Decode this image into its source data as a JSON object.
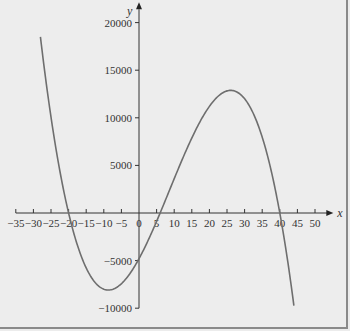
{
  "chart_data": {
    "type": "line",
    "title": "",
    "xlabel": "x",
    "ylabel": "y",
    "xlim": [
      -35,
      52
    ],
    "ylim": [
      -10000,
      21000
    ],
    "x_ticks": [
      -35,
      -30,
      -25,
      -20,
      -15,
      -10,
      -5,
      0,
      5,
      10,
      15,
      20,
      25,
      30,
      35,
      40,
      45,
      50
    ],
    "x_tick_labels": [
      "−35",
      "−30",
      "−25",
      "−20",
      "−15",
      "−10",
      "−5",
      "0",
      "5",
      "10",
      "15",
      "20",
      "25",
      "30",
      "35",
      "40",
      "45",
      "50"
    ],
    "y_ticks": [
      -10000,
      -5000,
      5000,
      10000,
      15000,
      20000
    ],
    "y_tick_labels": [
      "−10000",
      "−5000",
      "5000",
      "10000",
      "15000",
      "20000"
    ],
    "grid": false,
    "legend": "none",
    "series": [
      {
        "name": "cubic",
        "function": "y = -(x+20)(x-6)(x-40)",
        "roots": [
          -20,
          6,
          40
        ],
        "x_range": [
          -28,
          44
        ],
        "local_max": [
          27,
          12831
        ],
        "local_min": [
          -8,
          -8064
        ],
        "y_intercept": -4800,
        "color": "#6e6e6e"
      }
    ]
  }
}
